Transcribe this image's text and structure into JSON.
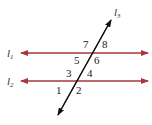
{
  "diagram": {
    "colors": {
      "parallel_line": "#a8373a",
      "transversal": "#111111",
      "text": "#222222"
    },
    "lines": {
      "l1": {
        "name": "l",
        "sub": "1",
        "y": 53
      },
      "l2": {
        "name": "l",
        "sub": "2",
        "y": 81
      },
      "l3": {
        "name": "l",
        "sub": "3"
      }
    },
    "angles": [
      "1",
      "2",
      "3",
      "4",
      "5",
      "6",
      "7",
      "8"
    ]
  }
}
